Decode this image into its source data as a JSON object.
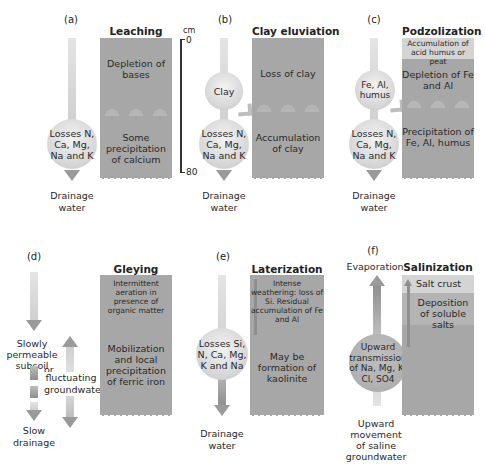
{
  "figure": {
    "panels": [
      {
        "id": "a",
        "letter": "(a)",
        "title": "Leaching",
        "zones": [
          "Depletion of bases",
          "Some precipitation of calcium"
        ],
        "balls": [
          "Losses N, Ca, Mg, Na and K"
        ],
        "bottom_label": "Drainage water"
      },
      {
        "id": "b",
        "letter": "(b)",
        "title": "Clay eluviation",
        "zones": [
          "Loss of clay",
          "Accumulation of clay"
        ],
        "balls": [
          "Clay",
          "Losses N, Ca, Mg, Na and K"
        ],
        "bottom_label": "Drainage water"
      },
      {
        "id": "c",
        "letter": "(c)",
        "title": "Podzolization",
        "top_band": "Accumulation of acid humus or peat",
        "zones": [
          "Depletion of Fe and Al",
          "Precipitation of Fe, Al, humus"
        ],
        "balls": [
          "Fe, Al, humus",
          "Losses N, Ca, Mg, Na and K"
        ],
        "bottom_label": "Drainage water"
      },
      {
        "id": "d",
        "letter": "(d)",
        "title": "Gleying",
        "zones": [
          "Intermittent aeration in presence of organic matter",
          "Mobilization and local precipitation of ferric iron"
        ],
        "labels": [
          "Slowly permeable subsoil",
          "or",
          "fluctuating groundwater"
        ],
        "bottom_label": "Slow drainage"
      },
      {
        "id": "e",
        "letter": "(e)",
        "title": "Laterization",
        "zones": [
          "Intense weathering: loss of Si. Residual accumulation of Fe and Al",
          "May be formation of kaolinite"
        ],
        "balls": [
          "Losses Si, N, Ca, Mg, K and Na"
        ],
        "bottom_label": "Drainage water"
      },
      {
        "id": "f",
        "letter": "(f)",
        "title": "Salinization",
        "top_label": "Evaporation",
        "top_band": "Salt crust",
        "zones": [
          "Deposition of soluble salts"
        ],
        "balls": [
          "Upward transmission of Na, Mg, K, Cl, SO4"
        ],
        "bottom_label": "Upward movement of saline groundwater"
      }
    ],
    "depth_scale": {
      "unit": "cm",
      "top": "0",
      "bottom": "80"
    },
    "colors": {
      "soil_column": "#a7a7a7",
      "top_band": "#d4d4d4",
      "arrow": "#9a9a9a",
      "ball": "#d9d9d9"
    }
  }
}
